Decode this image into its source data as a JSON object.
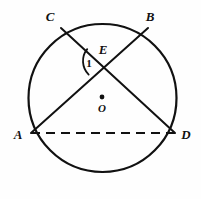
{
  "figure": {
    "type": "geometry-diagram",
    "background_color": "#fefefe",
    "stroke_color": "#111111",
    "canvas": {
      "width": 201,
      "height": 199
    }
  },
  "circle": {
    "name": "circle-O",
    "center": {
      "x": 102.5,
      "y": 98
    },
    "radius": 74,
    "stroke_width": 2.2,
    "fill": "none"
  },
  "center_marker": {
    "label": "O",
    "dot": {
      "x": 102,
      "y": 97,
      "r": 2.4
    },
    "label_pos": {
      "x": 102,
      "y": 112
    }
  },
  "points": [
    {
      "id": "C",
      "label": "C",
      "x": 61,
      "y": 28,
      "label_x": 50,
      "label_y": 21
    },
    {
      "id": "B",
      "label": "B",
      "x": 148,
      "y": 28,
      "label_x": 150,
      "label_y": 21
    },
    {
      "id": "E",
      "label": "E",
      "x": 102,
      "y": 61,
      "label_x": 103,
      "label_y": 54
    },
    {
      "id": "A",
      "label": "A",
      "x": 31,
      "y": 133,
      "label_x": 18,
      "label_y": 139
    },
    {
      "id": "D",
      "label": "D",
      "x": 175,
      "y": 133,
      "label_x": 186,
      "label_y": 139
    }
  ],
  "segments": [
    {
      "id": "CD",
      "from": "C",
      "to": "D",
      "style": "solid",
      "stroke_width": 2.0
    },
    {
      "id": "AB",
      "from": "A",
      "to": "B",
      "style": "solid",
      "stroke_width": 2.0
    },
    {
      "id": "AD",
      "from": "A",
      "to": "D",
      "style": "dashed",
      "stroke_width": 2.0,
      "dash_pattern": "9 6"
    }
  ],
  "angle_marker": {
    "label": "1",
    "at_vertex": "E",
    "between": [
      "EC",
      "EA"
    ],
    "label_pos": {
      "x": 89,
      "y": 67
    },
    "arc_radius": 19,
    "stroke_width": 1.8
  }
}
